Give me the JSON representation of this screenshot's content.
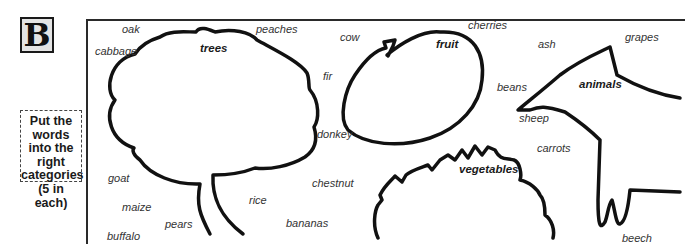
{
  "exercise": {
    "letter": "B",
    "instruction": "Put the words into the right categories (5 in each)"
  },
  "categories": {
    "trees": "trees",
    "fruit": "fruit",
    "animals": "animals",
    "vegetables": "vegetables"
  },
  "words": {
    "oak": "oak",
    "cabbage": "cabbage",
    "peaches": "peaches",
    "cow": "cow",
    "cherries": "cherries",
    "ash": "ash",
    "grapes": "grapes",
    "fir": "fir",
    "beans": "beans",
    "sheep": "sheep",
    "donkey": "donkey",
    "carrots": "carrots",
    "goat": "goat",
    "chestnut": "chestnut",
    "maize": "maize",
    "rice": "rice",
    "pears": "pears",
    "bananas": "bananas",
    "buffalo": "buffalo",
    "beech": "beech"
  },
  "colors": {
    "outline": "#111111",
    "letter_box_bg": "#e4e4e4",
    "word_text": "#333333"
  }
}
